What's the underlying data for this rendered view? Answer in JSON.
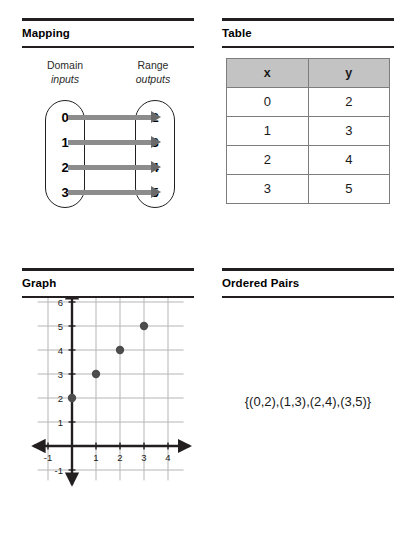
{
  "panels": {
    "mapping": {
      "title": "Mapping",
      "domain_label": "Domain",
      "domain_sub": "inputs",
      "range_label": "Range",
      "range_sub": "outputs",
      "domain_values": [
        "0",
        "1",
        "2",
        "3"
      ],
      "range_values": [
        "2",
        "3",
        "4",
        "5"
      ],
      "arrow_color": "#8c8c8c",
      "arrowhead_color": "#6a6a6a"
    },
    "table": {
      "title": "Table",
      "header_fill": "#c3c3c3",
      "columns": [
        "x",
        "y"
      ],
      "rows": [
        [
          "0",
          "2"
        ],
        [
          "1",
          "3"
        ],
        [
          "2",
          "4"
        ],
        [
          "3",
          "5"
        ]
      ]
    },
    "graph": {
      "title": "Graph"
    },
    "ordered_pairs": {
      "title": "Ordered Pairs",
      "set_text": "{(0,2),(1,3),(2,4),(3,5)}"
    }
  },
  "chart_data": {
    "type": "scatter",
    "title": "Graph",
    "xlabel": "",
    "ylabel": "",
    "x": [
      0,
      1,
      2,
      3
    ],
    "y": [
      2,
      3,
      4,
      5
    ],
    "point_color": "#4d4d4d",
    "grid": true,
    "grid_color": "#b5b5b5",
    "axis_color": "#231f20",
    "xlim": [
      -1.6,
      4.9
    ],
    "ylim": [
      -1.6,
      6.6
    ],
    "xticks": [
      -1,
      1,
      2,
      3,
      4
    ],
    "xtick_labels": [
      "-1",
      "1",
      "2",
      "3",
      "4"
    ],
    "yticks": [
      -1,
      1,
      2,
      3,
      4,
      5,
      6
    ],
    "ytick_labels": [
      "-1",
      "1",
      "2",
      "3",
      "4",
      "5",
      "6"
    ],
    "xgridlines": [
      -1,
      1,
      2,
      3,
      4
    ],
    "ygridlines": [
      -1,
      1,
      2,
      3,
      4,
      5,
      6
    ]
  }
}
